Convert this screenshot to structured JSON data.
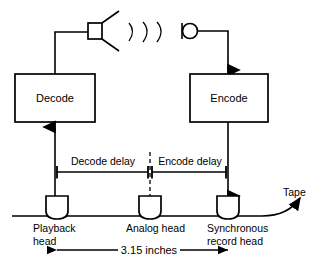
{
  "diagram": {
    "blocks": [
      {
        "id": "decode",
        "label": "Decode"
      },
      {
        "id": "encode",
        "label": "Encode"
      }
    ],
    "transducers": [
      {
        "id": "speaker",
        "icon": "speaker-icon",
        "waves": 3
      },
      {
        "id": "microphone",
        "icon": "microphone-icon"
      }
    ],
    "delays": [
      {
        "id": "decode_delay",
        "label": "Decode delay"
      },
      {
        "id": "encode_delay",
        "label": "Encode delay"
      }
    ],
    "heads": [
      {
        "id": "playback",
        "line1": "Playback",
        "line2": "head"
      },
      {
        "id": "analog",
        "line1": "Analog head",
        "line2": ""
      },
      {
        "id": "record",
        "line1": "Synchronous",
        "line2": "record head"
      }
    ],
    "tape": {
      "label": "Tape"
    },
    "dimension": {
      "label": "3.15 inches"
    },
    "colors": {
      "stroke": "#000000",
      "background": "#ffffff"
    }
  }
}
